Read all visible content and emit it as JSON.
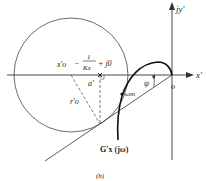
{
  "figure": {
    "caption": "(b)",
    "axes": {
      "x_label": "x′",
      "y_label": "jy′",
      "origin_label": "o"
    },
    "labels": {
      "center": "x′o",
      "center_value_prefix": "−",
      "center_value_num": "1",
      "center_value_den": "Kx",
      "center_value_suffix": "+ j0",
      "a_prime": "a′",
      "radius": "r′o",
      "omega_m": "ωm",
      "psi": "ψ",
      "curve": "G′x (jω)"
    },
    "colors": {
      "line": "#333333",
      "curve": "#111111",
      "background": "#ffffff"
    }
  }
}
